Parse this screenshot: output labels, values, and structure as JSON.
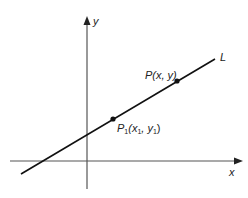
{
  "diagram": {
    "type": "coordinate-plane-line",
    "axes": {
      "x_label": "x",
      "y_label": "y",
      "origin_px": [
        87,
        161
      ],
      "color": "#555555"
    },
    "line": {
      "label": "L",
      "start_px": [
        21,
        174
      ],
      "end_px": [
        215,
        59
      ],
      "color": "#111111"
    },
    "points": [
      {
        "name": "P",
        "label_main": "P",
        "label_args": "(x, y)",
        "px": [
          177,
          81
        ]
      },
      {
        "name": "P1",
        "label_main": "P",
        "label_sub": "1",
        "px": [
          113,
          119
        ]
      }
    ],
    "p1_label": {
      "open": "(x",
      "sub1": "1",
      "mid": ", y",
      "sub2": "1",
      "close": ")"
    }
  }
}
